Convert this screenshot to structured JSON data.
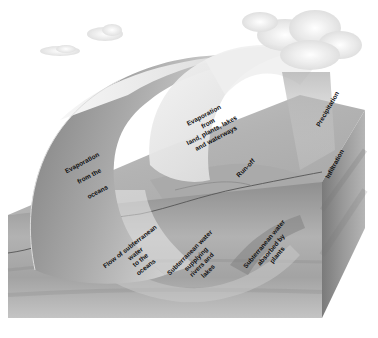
{
  "diagram": {
    "topic": "water cycle",
    "colors": {
      "background": "#ffffff",
      "block_top": "#b8b8b8",
      "block_front": "#9a9a9a",
      "block_side": "#8a8a8a",
      "arc_light": "#ececec",
      "arc_dark": "#8e8e8e",
      "cloud": "#f2f2f2",
      "text": "#111111"
    },
    "labels": {
      "evap_oceans": {
        "lines": [
          "Evaporation",
          "from the",
          "oceans"
        ]
      },
      "evap_land": {
        "lines": [
          "Evaporation",
          "from",
          "land, plants, lakes",
          "and waterways"
        ]
      },
      "runoff": {
        "lines": [
          "Run-off"
        ]
      },
      "precipitation": {
        "lines": [
          "Precipitation"
        ]
      },
      "infiltration": {
        "lines": [
          "Infiltration"
        ]
      },
      "flow_subterranean": {
        "lines": [
          "Flow of subterranean",
          "water",
          "to the",
          "oceans"
        ]
      },
      "subterranean_rivers": {
        "lines": [
          "Subterranean water",
          "supplying",
          "rivers and",
          "lakes"
        ]
      },
      "subterranean_plants": {
        "lines": [
          "Subterranean water",
          "absorbed by",
          "plants"
        ]
      }
    }
  }
}
